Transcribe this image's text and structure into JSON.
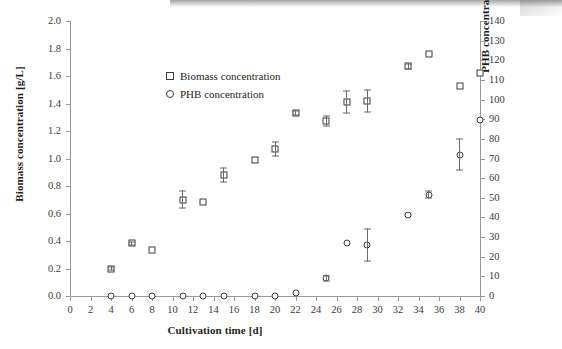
{
  "chart_data": {
    "type": "scatter",
    "title": "",
    "xlabel": "Cultivation time [d]",
    "ylabel": "Biomass concentration [g/L]",
    "y2label": "PHB concentration [mg/L]",
    "xlim": [
      0,
      40
    ],
    "ylim": [
      0.0,
      2.0
    ],
    "y2lim": [
      0,
      140
    ],
    "xticks": [
      0,
      2,
      4,
      6,
      8,
      10,
      12,
      14,
      16,
      18,
      20,
      22,
      24,
      26,
      28,
      30,
      32,
      34,
      36,
      38,
      40
    ],
    "yticks": [
      "0.0",
      "0.2",
      "0.4",
      "0.6",
      "0.8",
      "1.0",
      "1.2",
      "1.4",
      "1.6",
      "1.8",
      "2.0"
    ],
    "y2ticks": [
      0,
      10,
      20,
      30,
      40,
      50,
      60,
      70,
      80,
      90,
      100,
      110,
      120,
      130,
      140
    ],
    "grid": false,
    "legend_position": "upper-left",
    "series": [
      {
        "name": "Biomass concentration",
        "axis": "left",
        "marker": "square",
        "points": [
          {
            "x": 4,
            "y": 0.2,
            "err": 0.015
          },
          {
            "x": 6,
            "y": 0.385,
            "err": 0.015
          },
          {
            "x": 8,
            "y": 0.335,
            "err": 0.0
          },
          {
            "x": 11,
            "y": 0.7,
            "err": 0.065
          },
          {
            "x": 13,
            "y": 0.685,
            "err": 0.0
          },
          {
            "x": 15,
            "y": 0.88,
            "err": 0.055
          },
          {
            "x": 18,
            "y": 0.99,
            "err": 0.0
          },
          {
            "x": 20,
            "y": 1.07,
            "err": 0.055
          },
          {
            "x": 22,
            "y": 1.33,
            "err": 0.02
          },
          {
            "x": 25,
            "y": 1.27,
            "err": 0.04
          },
          {
            "x": 27,
            "y": 1.41,
            "err": 0.085
          },
          {
            "x": 29,
            "y": 1.42,
            "err": 0.085
          },
          {
            "x": 33,
            "y": 1.67,
            "err": 0.02
          },
          {
            "x": 35,
            "y": 1.76,
            "err": 0.0
          },
          {
            "x": 38,
            "y": 1.53,
            "err": 0.0
          },
          {
            "x": 40,
            "y": 1.62,
            "err": 0.0
          }
        ]
      },
      {
        "name": "PHB concentration",
        "axis": "right",
        "marker": "circle",
        "points": [
          {
            "x": 4,
            "y": 0.0,
            "err": 0
          },
          {
            "x": 6,
            "y": 0.0,
            "err": 0
          },
          {
            "x": 8,
            "y": 0.0,
            "err": 0
          },
          {
            "x": 11,
            "y": 0.0,
            "err": 0
          },
          {
            "x": 13,
            "y": 0.0,
            "err": 0
          },
          {
            "x": 15,
            "y": 0.0,
            "err": 0
          },
          {
            "x": 18,
            "y": 0.0,
            "err": 0
          },
          {
            "x": 20,
            "y": 0.0,
            "err": 0
          },
          {
            "x": 22,
            "y": 1.5,
            "err": 0
          },
          {
            "x": 25,
            "y": 9.0,
            "err": 1.5
          },
          {
            "x": 27,
            "y": 27.0,
            "err": 0
          },
          {
            "x": 29,
            "y": 26.0,
            "err": 8.5
          },
          {
            "x": 33,
            "y": 41.0,
            "err": 0
          },
          {
            "x": 35,
            "y": 51.5,
            "err": 2.0
          },
          {
            "x": 38,
            "y": 72.0,
            "err": 8.0
          },
          {
            "x": 40,
            "y": 89.5,
            "err": 0
          }
        ]
      }
    ]
  },
  "legend": {
    "items": [
      {
        "label": "Biomass concentration",
        "marker": "square"
      },
      {
        "label": "PHB concentration",
        "marker": "circle"
      }
    ]
  }
}
